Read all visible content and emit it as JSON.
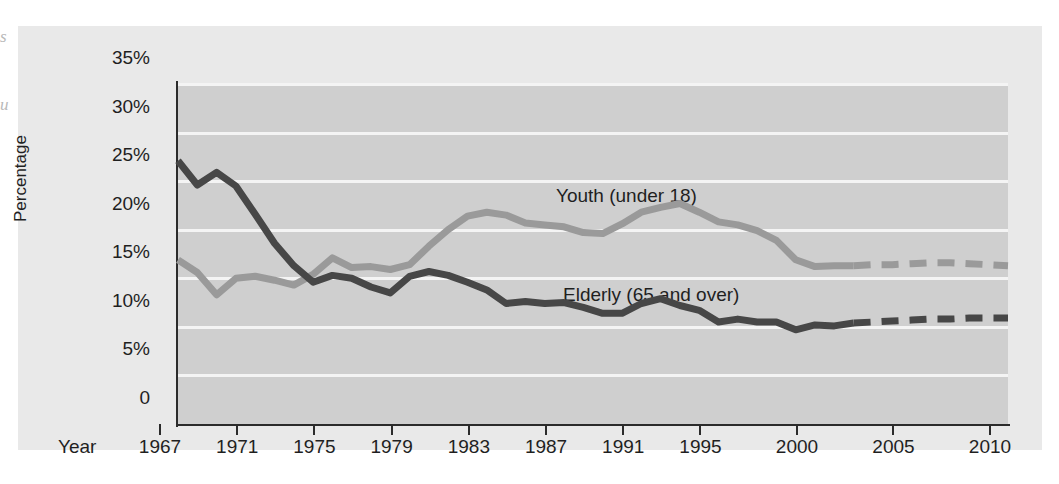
{
  "figure": {
    "margin_glyphs": [
      "s",
      "u"
    ]
  },
  "axes": {
    "y_title": "Percentage",
    "x_title": "Year",
    "y_ticks": [
      "35%",
      "30%",
      "25%",
      "20%",
      "15%",
      "10%",
      "5%",
      "0"
    ],
    "x_ticks": [
      "1967",
      "1971",
      "1975",
      "1979",
      "1983",
      "1987",
      "1991",
      "1995",
      "2000",
      "2005",
      "2010"
    ]
  },
  "labels": {
    "youth": "Youth (under 18)",
    "elderly": "Elderly (65 and over)"
  },
  "colors": {
    "page_background": "#ffffff",
    "panel_background": "#e9e9e9",
    "plot_background": "#cfcfcf",
    "gridline": "#f4f4f4",
    "axis": "#2b2b2b",
    "youth_line": "#9a9a9a",
    "elderly_line": "#474747",
    "text": "#1f1f1f"
  },
  "chart_data": {
    "type": "line",
    "title": "",
    "subtitle": "",
    "xlabel": "Year",
    "ylabel": "Percentage",
    "xlim": [
      1967,
      2010
    ],
    "ylim": [
      0,
      35
    ],
    "y_tick_values": [
      0,
      5,
      10,
      15,
      20,
      25,
      30,
      35
    ],
    "x_tick_values": [
      1967,
      1971,
      1975,
      1979,
      1983,
      1987,
      1991,
      1995,
      2000,
      2005,
      2010
    ],
    "grid": "horizontal",
    "legend_position": "inline-annotations",
    "projection_starts": 2002,
    "note": "Values after 2002 are projections, drawn as dashed segments.",
    "series": [
      {
        "name": "Youth (under 18)",
        "color": "#9a9a9a",
        "style": "solid-then-dashed",
        "x": [
          1967,
          1968,
          1969,
          1970,
          1971,
          1972,
          1973,
          1974,
          1975,
          1976,
          1977,
          1978,
          1979,
          1980,
          1981,
          1982,
          1983,
          1984,
          1985,
          1986,
          1987,
          1988,
          1989,
          1990,
          1991,
          1992,
          1993,
          1994,
          1995,
          1996,
          1997,
          1998,
          1999,
          2000,
          2001,
          2002,
          2003,
          2004,
          2005,
          2006,
          2007,
          2008,
          2009,
          2010
        ],
        "values": [
          16.9,
          15.6,
          13.3,
          15.0,
          15.2,
          14.8,
          14.3,
          15.4,
          17.1,
          16.1,
          16.2,
          15.9,
          16.4,
          18.3,
          20.0,
          21.4,
          21.8,
          21.5,
          20.7,
          20.5,
          20.3,
          19.7,
          19.6,
          20.6,
          21.8,
          22.3,
          22.7,
          21.8,
          20.8,
          20.5,
          19.9,
          18.9,
          16.9,
          16.2,
          16.3,
          16.3,
          16.4,
          16.4,
          16.5,
          16.6,
          16.6,
          16.5,
          16.4,
          16.3
        ],
        "units": "percent"
      },
      {
        "name": "Elderly (65 and over)",
        "color": "#474747",
        "style": "solid-then-dashed",
        "x": [
          1967,
          1968,
          1969,
          1970,
          1971,
          1972,
          1973,
          1974,
          1975,
          1976,
          1977,
          1978,
          1979,
          1980,
          1981,
          1982,
          1983,
          1984,
          1985,
          1986,
          1987,
          1988,
          1989,
          1990,
          1991,
          1992,
          1993,
          1994,
          1995,
          1996,
          1997,
          1998,
          1999,
          2000,
          2001,
          2002,
          2003,
          2004,
          2005,
          2006,
          2007,
          2008,
          2009,
          2010
        ],
        "values": [
          27.1,
          24.6,
          25.9,
          24.5,
          21.6,
          18.6,
          16.3,
          14.6,
          15.3,
          15.0,
          14.1,
          13.5,
          15.2,
          15.7,
          15.3,
          14.6,
          13.8,
          12.4,
          12.6,
          12.4,
          12.5,
          12.0,
          11.4,
          11.4,
          12.4,
          12.9,
          12.2,
          11.7,
          10.5,
          10.8,
          10.5,
          10.5,
          9.7,
          10.2,
          10.1,
          10.4,
          10.5,
          10.6,
          10.7,
          10.8,
          10.8,
          10.9,
          10.9,
          10.9
        ],
        "units": "percent"
      }
    ]
  }
}
